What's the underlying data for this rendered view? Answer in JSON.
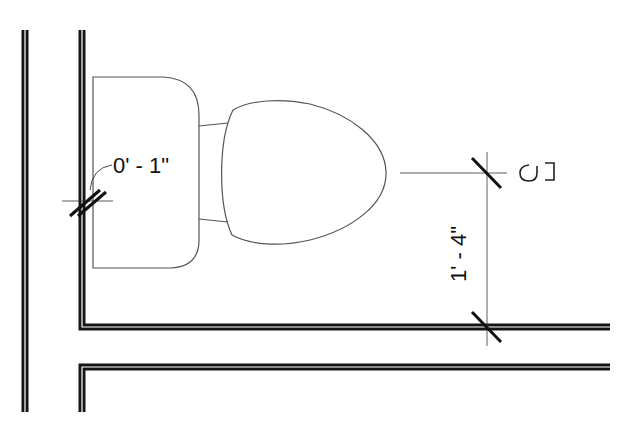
{
  "drawing": {
    "type": "plumbing fixture plan",
    "fixture": "water closet (toilet) with tank and elongated bowl",
    "colors": {
      "wall": "#151515",
      "fixture_line": "#555555",
      "dim_line": "#333333",
      "background": "#ffffff"
    }
  },
  "annotations": {
    "tank_clearance": "0' - 1\"",
    "centerline_offset": "1' - 4\"",
    "centerline_symbol": "CL"
  }
}
